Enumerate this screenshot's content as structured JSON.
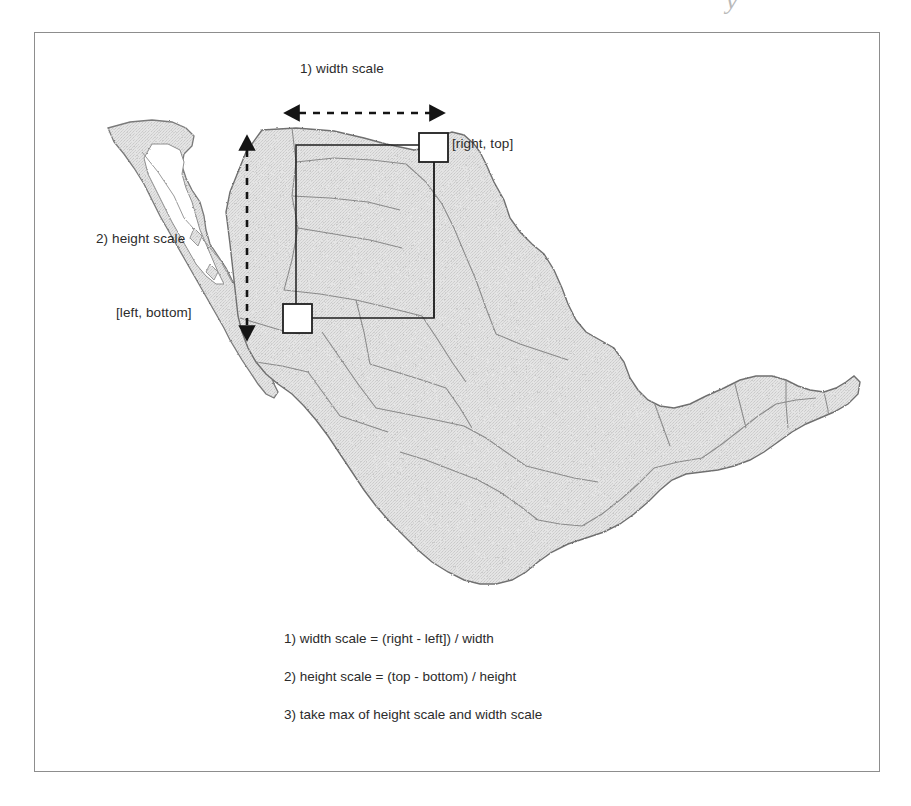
{
  "figure": {
    "scan_artifact": "y",
    "map_region_name": "Mexico"
  },
  "annotations": {
    "width_scale_label": "1) width scale",
    "height_scale_label": "2) height scale",
    "corner_top_right_label": "[right, top]",
    "corner_bottom_left_label": "[left, bottom]"
  },
  "formulas": [
    "1) width scale = (right - left]) / width",
    "2) height scale = (top - bottom) / height",
    "3) take max of height scale and width scale"
  ],
  "colors": {
    "frame_border": "#8d8d8d",
    "map_fill": "#dcdcdc",
    "map_outline": "#6f6f6f",
    "state_border": "#8a8a8a",
    "overlay_line": "#1f1f1f",
    "handle_fill": "#ffffff",
    "text": "#2b2b2b"
  },
  "selection_rect": {
    "left": 296,
    "top": 145,
    "right": 434,
    "bottom": 318
  },
  "arrows": {
    "width_arrow": {
      "x1": 297,
      "x2": 432,
      "y": 113,
      "style": "dashed",
      "heads": "both"
    },
    "height_arrow": {
      "x": 247,
      "y1": 143,
      "y2": 333,
      "style": "dashed",
      "heads": "both"
    }
  },
  "handles": [
    {
      "name": "top-right",
      "x": 419,
      "y": 133,
      "size": 28
    },
    {
      "name": "bottom-left",
      "x": 283,
      "y": 304,
      "size": 28
    }
  ]
}
